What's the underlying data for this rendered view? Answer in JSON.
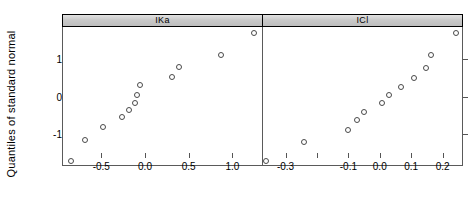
{
  "figure": {
    "ylabel": "Quantiles of standard normal",
    "width": 475,
    "height": 208,
    "marker": "open-circle",
    "marker_color": "#4a4a4a",
    "strip_color": "#c9c9c9",
    "background": "#ffffff"
  },
  "chart_data": {
    "type": "scatter",
    "title": "",
    "subtitle": "",
    "xlabel": "",
    "ylabel": "Quantiles of standard normal",
    "grid": false,
    "legend": "none",
    "layout": "1 row x 2 columns, shared y-axis, independent x-axis (lattice qqmath)",
    "panels": [
      {
        "label": "IKa",
        "xlabel": "",
        "ylabel": "Quantiles of standard normal",
        "xlim": [
          -0.95,
          1.35
        ],
        "ylim": [
          -1.85,
          1.85
        ],
        "xticks": [
          -0.5,
          0.0,
          0.5,
          1.0
        ],
        "xtick_labels": [
          "-0.5",
          "0.0",
          "0.5",
          "1.0"
        ],
        "yticks": [
          -1,
          0,
          1
        ],
        "ytick_labels": [
          "-1",
          "0",
          "1"
        ],
        "n": 12,
        "x": [
          -0.86,
          -0.7,
          -0.49,
          -0.28,
          -0.19,
          -0.13,
          -0.1,
          -0.07,
          0.3,
          0.38,
          0.86,
          1.23
        ],
        "y": [
          -1.73,
          -1.15,
          -0.82,
          -0.55,
          -0.35,
          -0.17,
          0.05,
          0.3,
          0.52,
          0.78,
          1.1,
          1.7
        ]
      },
      {
        "label": "ICl",
        "xlabel": "",
        "ylabel": "Quantiles of standard normal",
        "xlim": [
          -0.375,
          0.265
        ],
        "ylim": [
          -1.85,
          1.85
        ],
        "xticks": [
          -0.3,
          -0.2,
          -0.1,
          0.0,
          0.1,
          0.2
        ],
        "xtick_labels": [
          "-0.3",
          "",
          "-0.1",
          "0.0",
          "0.1",
          "0.2"
        ],
        "yticks": [
          -1,
          0,
          1
        ],
        "ytick_labels": [
          "-1",
          "0",
          "1"
        ],
        "n": 12,
        "x": [
          -0.365,
          -0.245,
          -0.105,
          -0.075,
          -0.055,
          0.005,
          0.025,
          0.065,
          0.105,
          0.145,
          0.16,
          0.24
        ],
        "y": [
          -1.73,
          -1.2,
          -0.9,
          -0.62,
          -0.42,
          -0.18,
          0.04,
          0.25,
          0.5,
          0.75,
          1.1,
          1.68
        ]
      }
    ]
  }
}
